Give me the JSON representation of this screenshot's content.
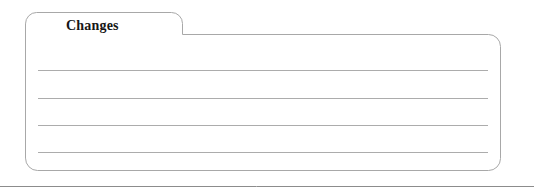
{
  "panel": {
    "kind": "tabbed-folder-note-card",
    "tab": {
      "label": "Changes",
      "selected": true
    },
    "body": {
      "ruled_lines_count": 4,
      "content_lines": [
        "",
        "",
        "",
        ""
      ]
    },
    "colors": {
      "background": "#ffffff",
      "outline": "#a8a8a8",
      "rule_line": "#acacac",
      "divider": "#8c8c8c",
      "label_text": "#161616"
    },
    "geometry": {
      "card_left": 25,
      "card_right": 500,
      "card_body_top": 34,
      "card_bottom": 170,
      "card_corner_radius": 12,
      "tab_top": 12,
      "tab_right": 182,
      "tab_corner_radius": 11,
      "rule_left": 38,
      "rule_right": 488,
      "rule_y_positions": [
        70,
        98,
        125,
        152
      ],
      "divider_y": 186
    }
  },
  "footer": {
    "divider": "horizontal-rule"
  }
}
